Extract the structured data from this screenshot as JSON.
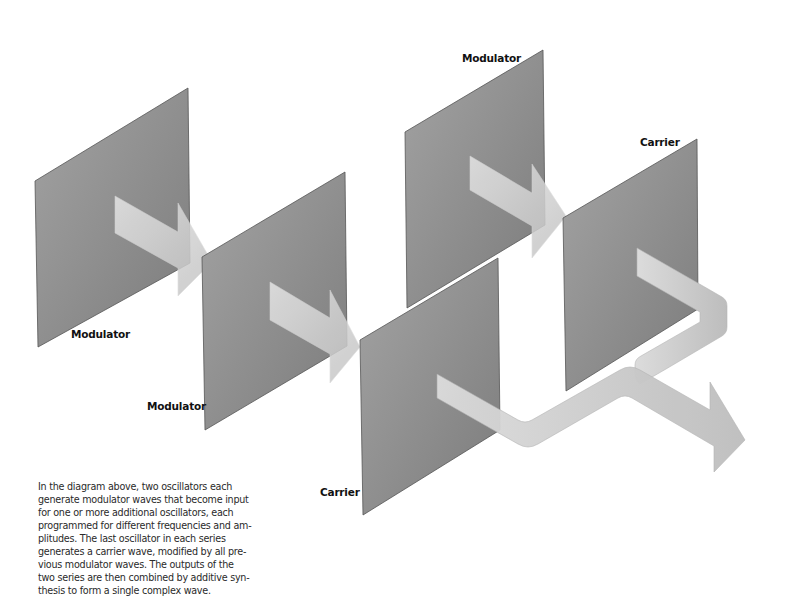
{
  "diagram": {
    "colors": {
      "panel_light": "#9d9d9d",
      "panel_dark": "#7f7f7f",
      "arrow_light": "#e2e2e2",
      "arrow_dark": "#c3c3c3",
      "label_text": "#111111",
      "background": "#ffffff"
    },
    "series": [
      {
        "name": "Series 1",
        "oscillators": [
          {
            "id": "osc-1",
            "role": "Modulator",
            "label": "Modulator"
          },
          {
            "id": "osc-2",
            "role": "Modulator",
            "label": "Modulator"
          },
          {
            "id": "osc-3",
            "role": "Carrier",
            "label": "Carrier"
          }
        ]
      },
      {
        "name": "Series 2",
        "oscillators": [
          {
            "id": "osc-4",
            "role": "Modulator",
            "label": "Modulator"
          },
          {
            "id": "osc-5",
            "role": "Carrier",
            "label": "Carrier"
          }
        ]
      }
    ],
    "labels": {
      "osc1": "Modulator",
      "osc2": "Modulator",
      "osc3": "Carrier",
      "osc4": "Modulator",
      "osc5": "Carrier"
    },
    "output": "Combined complex wave"
  },
  "caption": {
    "lines": [
      "In the diagram above, two oscillators each",
      "generate modulator waves that become input",
      "for one or more additional oscillators, each",
      "programmed for different frequencies and am-",
      "plitudes. The last oscillator in each series",
      "generates a carrier wave, modified by all pre-",
      "vious modulator waves. The outputs of the",
      "two series are then combined by additive syn-",
      "thesis to form a single complex wave."
    ]
  }
}
